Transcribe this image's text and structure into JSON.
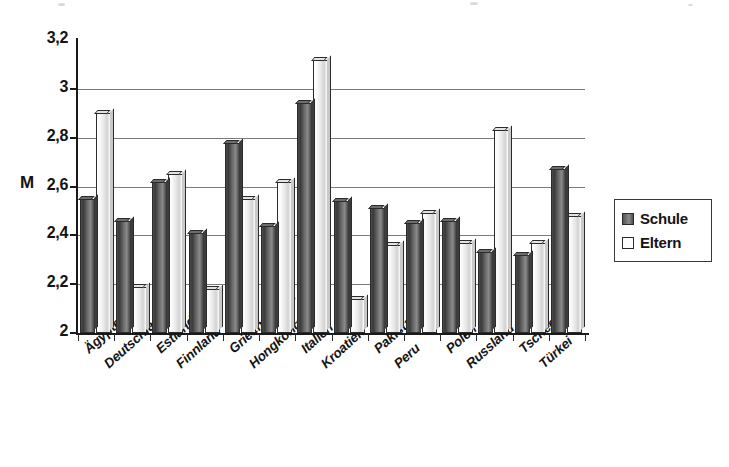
{
  "chart_data": {
    "type": "bar",
    "title": "",
    "subtitle": "",
    "xlabel": "",
    "ylabel": "M",
    "ylim": [
      2,
      3.2
    ],
    "yticks": [
      "2",
      "2,2",
      "2,4",
      "2,6",
      "2,8",
      "3",
      "3,2"
    ],
    "ytick_values": [
      2,
      2.2,
      2.4,
      2.6,
      2.8,
      3,
      3.2
    ],
    "grid": "horizontal",
    "legend_position": "right",
    "decimal_separator": ",",
    "categories": [
      "Ägypten",
      "Deutschland",
      "Estland",
      "Finnland",
      "Griechenland",
      "Hongkong",
      "Italien",
      "Kroatien",
      "Pakistan",
      "Peru",
      "Polen",
      "Russland",
      "Tschechien",
      "Türkei"
    ],
    "series": [
      {
        "name": "Schule",
        "color": "#6e6e6e",
        "values": [
          2.55,
          2.46,
          2.62,
          2.41,
          2.78,
          2.44,
          2.94,
          2.54,
          2.51,
          2.45,
          2.46,
          2.33,
          2.32,
          2.67
        ]
      },
      {
        "name": "Eltern",
        "color": "#f2f2f2",
        "values": [
          2.9,
          2.19,
          2.65,
          2.18,
          2.55,
          2.62,
          3.12,
          2.14,
          2.36,
          2.49,
          2.37,
          2.83,
          2.37,
          2.48
        ]
      }
    ]
  },
  "axis": {
    "y_title": "M"
  },
  "legend": {
    "items": [
      {
        "label": "Schule",
        "swatch": "dark-gray"
      },
      {
        "label": "Eltern",
        "swatch": "white"
      }
    ]
  }
}
